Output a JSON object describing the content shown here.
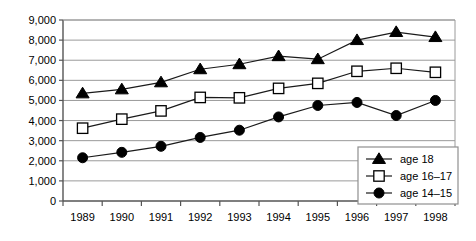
{
  "chart_data": {
    "type": "line",
    "title": "",
    "subtitle": "",
    "xlabel": "",
    "ylabel": "",
    "categories": [
      "1989",
      "1990",
      "1991",
      "1992",
      "1993",
      "1994",
      "1995",
      "1996",
      "1997",
      "1998"
    ],
    "ylim": [
      0,
      9000
    ],
    "ytick_labels": [
      "0",
      "1,000",
      "2,000",
      "3,000",
      "4,000",
      "5,000",
      "6,000",
      "7,000",
      "8,000",
      "9,000"
    ],
    "ytick_values": [
      0,
      1000,
      2000,
      3000,
      4000,
      5000,
      6000,
      7000,
      8000,
      9000
    ],
    "grid": true,
    "grid_axis": "y",
    "legend_position": "bottom-right",
    "series": [
      {
        "name": "age 18",
        "marker": "filled-triangle",
        "color": "#000000",
        "values": [
          5350,
          5550,
          5900,
          6550,
          6800,
          7200,
          7050,
          8000,
          8400,
          8150
        ]
      },
      {
        "name": "age 16–17",
        "marker": "open-square",
        "color": "#000000",
        "values": [
          3620,
          4070,
          4480,
          5150,
          5130,
          5600,
          5850,
          6450,
          6600,
          6400
        ]
      },
      {
        "name": "age 14–15",
        "marker": "filled-circle",
        "color": "#000000",
        "values": [
          2150,
          2420,
          2720,
          3160,
          3520,
          4180,
          4750,
          4900,
          4250,
          5000
        ]
      }
    ]
  },
  "legend": {
    "entries": [
      {
        "label": "age 18"
      },
      {
        "label": "age 16–17"
      },
      {
        "label": "age 14–15"
      }
    ]
  },
  "axes": {
    "y_tick_labels": [
      "9,000",
      "8,000",
      "7,000",
      "6,000",
      "5,000",
      "4,000",
      "3,000",
      "2,000",
      "1,000",
      "0"
    ],
    "x_tick_labels": [
      "1989",
      "1990",
      "1991",
      "1992",
      "1993",
      "1994",
      "1995",
      "1996",
      "1997",
      "1998"
    ]
  },
  "colors": {
    "line": "#1a1a1a",
    "grid": "#9a9a9a",
    "axis": "#555555",
    "marker_fill": "#000000",
    "marker_open_fill": "#ffffff",
    "background": "#ffffff"
  }
}
